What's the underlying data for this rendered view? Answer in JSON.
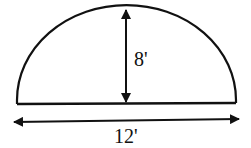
{
  "diagram": {
    "shape": "semi-ellipse",
    "height_label": "8'",
    "width_label": "12'",
    "stroke_color": "#111111",
    "background": "#ffffff"
  }
}
